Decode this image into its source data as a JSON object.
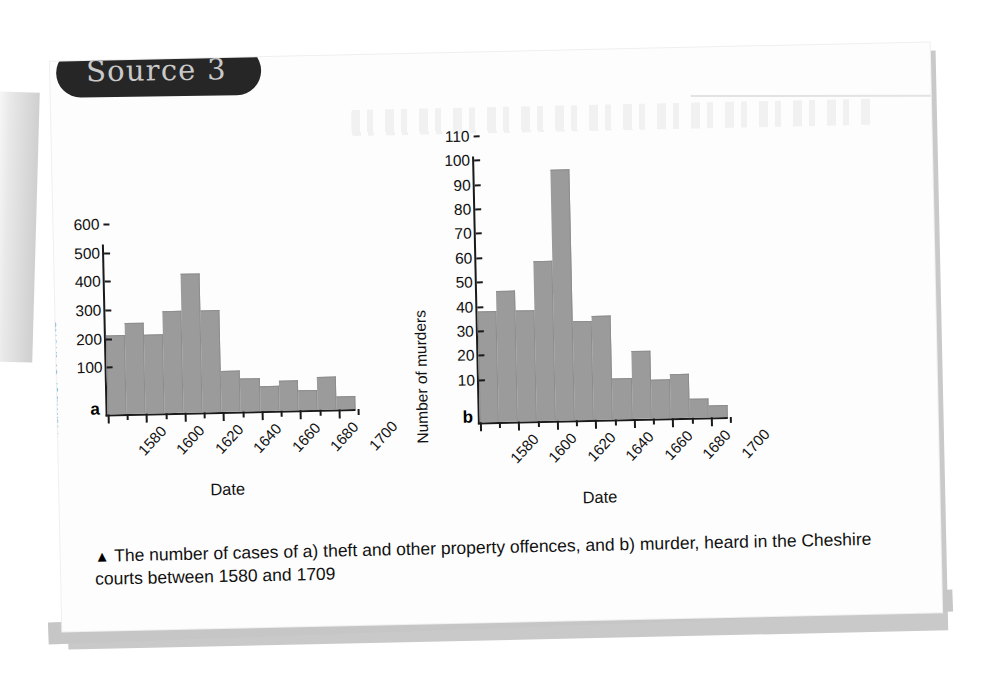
{
  "badge": {
    "label": "Source 3"
  },
  "caption": {
    "marker": "▲",
    "text": "The number of cases of a) theft and other property offences, and b) murder, heard in the Cheshire courts between 1580 and 1709"
  },
  "colors": {
    "bar_fill": "#9b9b9b",
    "axis": "#1a1a1a",
    "badge_bg": "#262626",
    "badge_text": "#c9c9c9",
    "card_bg": "#fdfdfd",
    "page_shadow": "#c9c9c9"
  },
  "chart_data": [
    {
      "id": "a",
      "panel_letter": "a",
      "type": "bar",
      "title": "",
      "xlabel": "Date",
      "ylabel": "Number of thefts",
      "ylim": [
        0,
        600
      ],
      "yticks": [
        100,
        200,
        300,
        400,
        500,
        600
      ],
      "xlim": [
        1580,
        1710
      ],
      "xticks": [
        1580,
        1600,
        1620,
        1640,
        1660,
        1680,
        1700
      ],
      "xtick_labels": [
        "1580",
        "1600",
        "1620",
        "1640",
        "1660",
        "1680",
        "1700"
      ],
      "bin_width": 10,
      "grid": false,
      "legend": "none",
      "categories": [
        "1580-89",
        "1590-99",
        "1600-09",
        "1610-19",
        "1620-29",
        "1630-39",
        "1640-49",
        "1650-59",
        "1660-69",
        "1670-79",
        "1680-89",
        "1690-99",
        "1700-09"
      ],
      "values": [
        280,
        320,
        280,
        360,
        490,
        360,
        145,
        115,
        90,
        105,
        70,
        115,
        45
      ]
    },
    {
      "id": "b",
      "panel_letter": "b",
      "type": "bar",
      "title": "",
      "xlabel": "Date",
      "ylabel": "Number of murders",
      "ylim": [
        0,
        110
      ],
      "yticks": [
        10,
        20,
        30,
        40,
        50,
        60,
        70,
        80,
        90,
        100,
        110
      ],
      "xlim": [
        1580,
        1710
      ],
      "xticks": [
        1580,
        1600,
        1620,
        1640,
        1660,
        1680,
        1700
      ],
      "xtick_labels": [
        "1580",
        "1600",
        "1620",
        "1640",
        "1660",
        "1680",
        "1700"
      ],
      "bin_width": 10,
      "grid": false,
      "legend": "none",
      "categories": [
        "1580-89",
        "1590-99",
        "1600-09",
        "1610-19",
        "1620-29",
        "1630-39",
        "1640-49",
        "1650-59",
        "1660-69",
        "1670-79",
        "1680-89",
        "1690-99",
        "1700-09"
      ],
      "values": [
        46,
        54,
        46,
        66,
        104,
        41,
        43,
        17,
        28,
        16,
        18,
        8,
        5
      ]
    }
  ]
}
